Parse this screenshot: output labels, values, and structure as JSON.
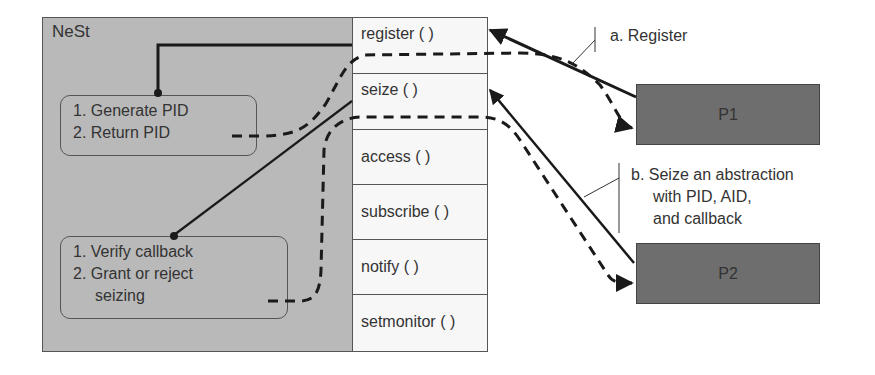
{
  "nest": {
    "label": "NeSt",
    "register_handler": {
      "steps": [
        "1. Generate PID",
        "2. Return PID"
      ]
    },
    "seize_handler": {
      "steps": [
        "1. Verify callback",
        "2. Grant or reject",
        "seizing"
      ]
    }
  },
  "api": {
    "functions": [
      {
        "label": "register ( )"
      },
      {
        "label": "seize ( )"
      },
      {
        "label": "access ( )"
      },
      {
        "label": "subscribe ( )"
      },
      {
        "label": "notify ( )"
      },
      {
        "label": "setmonitor ( )"
      }
    ]
  },
  "processes": [
    {
      "label": "P1"
    },
    {
      "label": "P2"
    }
  ],
  "annotations": {
    "a": {
      "lines": [
        "a. Register"
      ]
    },
    "b": {
      "lines": [
        "b. Seize an abstraction",
        "with PID, AID,",
        "and callback"
      ]
    }
  },
  "legend": {
    "solid_line": "request call",
    "dashed_line": "response/return"
  },
  "colors": {
    "nest_bg": "#b9b9b9",
    "api_bg": "#f7f7f7",
    "process_bg": "#6e6e6e",
    "line": "#1a1a1a"
  }
}
